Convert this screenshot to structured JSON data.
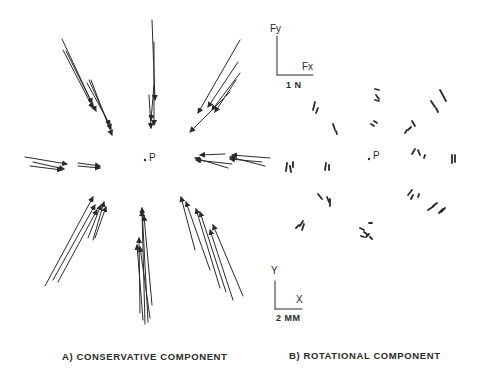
{
  "panels": [
    {
      "id": "A",
      "caption": "A) CONSERVATIVE COMPONENT",
      "center_label": "P",
      "center": [
        145,
        160
      ],
      "arrows": [
        [
          62,
          39,
          92,
          103
        ],
        [
          63,
          50,
          93,
          108
        ],
        [
          66,
          51,
          96,
          111
        ],
        [
          89,
          80,
          111,
          129
        ],
        [
          91,
          80,
          112,
          135
        ],
        [
          87,
          83,
          110,
          125
        ],
        [
          152,
          20,
          155,
          100
        ],
        [
          154,
          42,
          154,
          125
        ],
        [
          149,
          95,
          151,
          128
        ],
        [
          154,
          85,
          151,
          120
        ],
        [
          240,
          40,
          198,
          113
        ],
        [
          238,
          62,
          208,
          107
        ],
        [
          240,
          73,
          212,
          110
        ],
        [
          236,
          80,
          215,
          112
        ],
        [
          230,
          92,
          190,
          132
        ],
        [
          25,
          157,
          67,
          164
        ],
        [
          33,
          162,
          64,
          169
        ],
        [
          30,
          166,
          62,
          170
        ],
        [
          78,
          163,
          100,
          166
        ],
        [
          78,
          166,
          100,
          168
        ],
        [
          225,
          154,
          200,
          155
        ],
        [
          228,
          168,
          195,
          158
        ],
        [
          232,
          164,
          196,
          160
        ],
        [
          270,
          158,
          232,
          155
        ],
        [
          265,
          166,
          230,
          157
        ],
        [
          262,
          162,
          230,
          159
        ],
        [
          45,
          286,
          93,
          197
        ],
        [
          53,
          280,
          95,
          205
        ],
        [
          58,
          282,
          97,
          210
        ],
        [
          88,
          238,
          101,
          205
        ],
        [
          93,
          240,
          104,
          202
        ],
        [
          95,
          238,
          106,
          207
        ],
        [
          140,
          313,
          139,
          238
        ],
        [
          145,
          324,
          142,
          211
        ],
        [
          148,
          322,
          142,
          208
        ],
        [
          152,
          305,
          144,
          216
        ],
        [
          143,
          320,
          137,
          245
        ],
        [
          150,
          318,
          140,
          247
        ],
        [
          195,
          250,
          181,
          197
        ],
        [
          210,
          270,
          186,
          202
        ],
        [
          220,
          288,
          196,
          209
        ],
        [
          226,
          292,
          200,
          212
        ],
        [
          243,
          296,
          213,
          225
        ],
        [
          233,
          300,
          210,
          230
        ]
      ]
    },
    {
      "id": "B",
      "caption": "B) ROTATIONAL COMPONENT",
      "center_label": "P",
      "center": [
        369,
        159
      ],
      "arrows": [
        [
          315,
          102,
          313,
          110
        ],
        [
          318,
          108,
          316,
          113
        ],
        [
          333,
          124,
          335,
          130
        ],
        [
          336,
          131,
          337,
          134
        ],
        [
          375,
          89,
          379,
          90
        ],
        [
          376,
          95,
          379,
          99
        ],
        [
          375,
          100,
          379,
          101
        ],
        [
          374,
          121,
          377,
          123
        ],
        [
          371,
          124,
          374,
          126
        ],
        [
          440,
          90,
          446,
          101
        ],
        [
          431,
          101,
          435,
          107
        ],
        [
          436,
          108,
          438,
          112
        ],
        [
          412,
          121,
          415,
          126
        ],
        [
          411,
          127,
          408,
          130
        ],
        [
          407,
          130,
          405,
          133
        ],
        [
          287,
          163,
          286,
          171
        ],
        [
          290,
          166,
          291,
          172
        ],
        [
          293,
          162,
          293,
          167
        ],
        [
          326,
          163,
          325,
          170
        ],
        [
          329,
          165,
          329,
          170
        ],
        [
          412,
          154,
          415,
          149
        ],
        [
          418,
          150,
          420,
          155
        ],
        [
          424,
          158,
          425,
          155
        ],
        [
          452,
          155,
          452,
          163
        ],
        [
          455,
          155,
          455,
          162
        ],
        [
          318,
          194,
          322,
          199
        ],
        [
          327,
          197,
          329,
          202
        ],
        [
          330,
          199,
          330,
          206
        ],
        [
          296,
          228,
          299,
          225
        ],
        [
          300,
          226,
          303,
          221
        ],
        [
          304,
          224,
          302,
          230
        ],
        [
          366,
          237,
          369,
          234
        ],
        [
          370,
          237,
          372,
          239
        ],
        [
          408,
          195,
          412,
          190
        ],
        [
          411,
          199,
          413,
          195
        ],
        [
          418,
          197,
          419,
          194
        ],
        [
          428,
          210,
          434,
          206
        ],
        [
          433,
          206,
          437,
          203
        ],
        [
          439,
          213,
          443,
          209
        ],
        [
          441,
          212,
          445,
          208
        ],
        [
          360,
          228,
          364,
          230
        ],
        [
          369,
          223,
          372,
          223
        ],
        [
          364,
          232,
          368,
          235
        ],
        [
          361,
          236,
          364,
          237
        ]
      ]
    }
  ],
  "scale_force": {
    "y_label": "Fy",
    "x_label": "Fx",
    "unit_label": "1 N",
    "origin": [
      277,
      75
    ],
    "y_top": 36,
    "x_right": 313
  },
  "scale_position": {
    "y_label": "Y",
    "x_label": "X",
    "unit_label": "2 MM",
    "origin": [
      275,
      309
    ],
    "y_top": 281,
    "x_right": 302
  },
  "colors": {
    "ink": "#2a2a2a",
    "background": "#ffffff"
  }
}
